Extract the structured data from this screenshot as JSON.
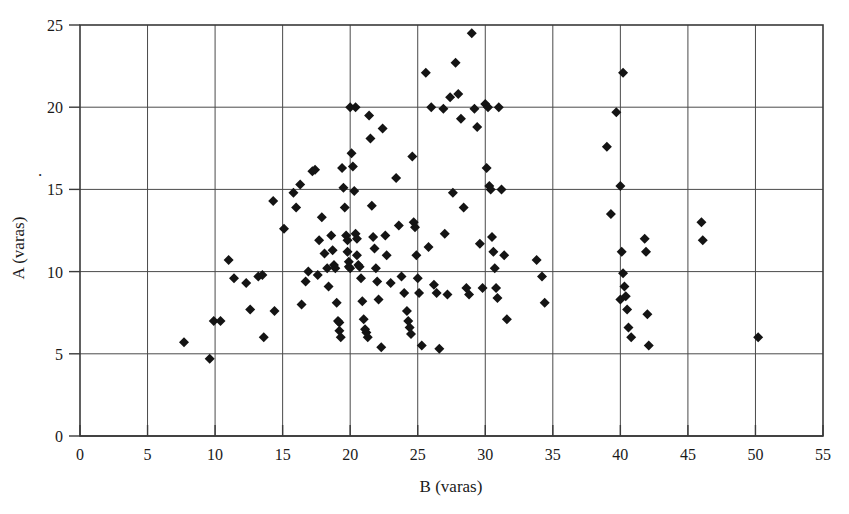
{
  "chart_data": {
    "type": "scatter",
    "title": "",
    "xlabel": "B (varas)",
    "ylabel": "A (varas)",
    "xlim": [
      0,
      55
    ],
    "ylim": [
      0,
      25
    ],
    "xticks": [
      0,
      5,
      10,
      15,
      20,
      25,
      30,
      35,
      40,
      45,
      50,
      55
    ],
    "yticks": [
      0,
      5,
      10,
      15,
      20,
      25
    ],
    "xtick_labels": [
      "0",
      "5",
      "10",
      "15",
      "20",
      "25",
      "30",
      "35",
      "40",
      "45",
      "50",
      "55"
    ],
    "ytick_labels": [
      "0",
      "5",
      "10",
      "15",
      "20",
      "25"
    ],
    "grid": true,
    "grid_x": true,
    "grid_y": true,
    "legend": false,
    "legend_position": "none",
    "marker": "diamond",
    "marker_color": "#141414",
    "marker_size": 9,
    "n_points": 146,
    "points": [
      [
        7.7,
        5.7
      ],
      [
        9.6,
        4.7
      ],
      [
        9.9,
        7.0
      ],
      [
        10.4,
        7.0
      ],
      [
        11.0,
        10.7
      ],
      [
        11.4,
        9.6
      ],
      [
        12.3,
        9.3
      ],
      [
        12.6,
        7.7
      ],
      [
        13.2,
        9.7
      ],
      [
        13.5,
        9.8
      ],
      [
        13.6,
        6.0
      ],
      [
        14.3,
        14.3
      ],
      [
        14.4,
        7.6
      ],
      [
        15.1,
        12.6
      ],
      [
        15.8,
        14.8
      ],
      [
        16.0,
        13.9
      ],
      [
        16.3,
        15.3
      ],
      [
        16.4,
        8.0
      ],
      [
        16.7,
        9.4
      ],
      [
        16.9,
        10.0
      ],
      [
        17.2,
        16.1
      ],
      [
        17.4,
        16.2
      ],
      [
        17.6,
        9.8
      ],
      [
        17.7,
        11.9
      ],
      [
        17.9,
        13.3
      ],
      [
        18.1,
        11.1
      ],
      [
        18.3,
        10.2
      ],
      [
        18.4,
        9.1
      ],
      [
        18.6,
        12.2
      ],
      [
        18.7,
        11.3
      ],
      [
        18.8,
        10.4
      ],
      [
        18.9,
        10.2
      ],
      [
        19.0,
        8.1
      ],
      [
        19.1,
        7.0
      ],
      [
        19.2,
        6.9
      ],
      [
        19.2,
        6.4
      ],
      [
        19.3,
        6.0
      ],
      [
        19.4,
        16.3
      ],
      [
        19.5,
        15.1
      ],
      [
        19.6,
        13.9
      ],
      [
        19.7,
        12.2
      ],
      [
        19.8,
        11.9
      ],
      [
        19.8,
        11.2
      ],
      [
        19.9,
        10.6
      ],
      [
        19.9,
        10.3
      ],
      [
        20.0,
        10.2
      ],
      [
        20.0,
        20.0
      ],
      [
        20.4,
        20.0
      ],
      [
        20.1,
        17.2
      ],
      [
        20.2,
        16.4
      ],
      [
        20.3,
        14.9
      ],
      [
        20.4,
        12.3
      ],
      [
        20.5,
        12.0
      ],
      [
        20.5,
        11.0
      ],
      [
        20.6,
        10.4
      ],
      [
        20.7,
        10.3
      ],
      [
        20.8,
        9.6
      ],
      [
        20.9,
        8.2
      ],
      [
        21.0,
        7.1
      ],
      [
        21.1,
        6.5
      ],
      [
        21.2,
        6.3
      ],
      [
        21.3,
        6.0
      ],
      [
        21.4,
        19.5
      ],
      [
        21.5,
        18.1
      ],
      [
        21.6,
        14.0
      ],
      [
        21.7,
        12.1
      ],
      [
        21.8,
        11.4
      ],
      [
        21.9,
        10.2
      ],
      [
        22.0,
        9.4
      ],
      [
        22.1,
        8.3
      ],
      [
        22.3,
        5.4
      ],
      [
        22.4,
        18.7
      ],
      [
        22.6,
        12.2
      ],
      [
        22.7,
        11.0
      ],
      [
        23.0,
        9.3
      ],
      [
        23.4,
        15.7
      ],
      [
        23.6,
        12.8
      ],
      [
        23.8,
        9.7
      ],
      [
        24.0,
        8.7
      ],
      [
        24.2,
        7.6
      ],
      [
        24.3,
        7.0
      ],
      [
        24.4,
        6.6
      ],
      [
        24.5,
        6.2
      ],
      [
        24.6,
        17.0
      ],
      [
        24.7,
        13.0
      ],
      [
        24.8,
        12.7
      ],
      [
        24.9,
        11.0
      ],
      [
        25.0,
        9.6
      ],
      [
        25.1,
        8.7
      ],
      [
        25.3,
        5.5
      ],
      [
        25.6,
        22.1
      ],
      [
        25.8,
        11.5
      ],
      [
        26.0,
        20.0
      ],
      [
        26.2,
        9.2
      ],
      [
        26.4,
        8.7
      ],
      [
        26.6,
        5.3
      ],
      [
        26.9,
        19.9
      ],
      [
        27.0,
        12.3
      ],
      [
        27.2,
        8.6
      ],
      [
        27.4,
        20.6
      ],
      [
        27.6,
        14.8
      ],
      [
        27.8,
        22.7
      ],
      [
        28.0,
        20.8
      ],
      [
        28.2,
        19.3
      ],
      [
        28.4,
        13.9
      ],
      [
        28.6,
        9.0
      ],
      [
        28.8,
        8.6
      ],
      [
        29.0,
        24.5
      ],
      [
        29.2,
        19.9
      ],
      [
        29.4,
        18.8
      ],
      [
        29.6,
        11.7
      ],
      [
        29.8,
        9.0
      ],
      [
        30.0,
        20.2
      ],
      [
        30.2,
        20.0
      ],
      [
        30.1,
        16.3
      ],
      [
        30.3,
        15.2
      ],
      [
        30.4,
        15.0
      ],
      [
        30.5,
        12.1
      ],
      [
        30.6,
        11.2
      ],
      [
        30.7,
        10.2
      ],
      [
        30.8,
        9.0
      ],
      [
        30.9,
        8.4
      ],
      [
        31.0,
        20.0
      ],
      [
        31.2,
        15.0
      ],
      [
        31.4,
        11.0
      ],
      [
        31.6,
        7.1
      ],
      [
        33.8,
        10.7
      ],
      [
        34.2,
        9.7
      ],
      [
        34.4,
        8.1
      ],
      [
        39.0,
        17.6
      ],
      [
        39.3,
        13.5
      ],
      [
        39.7,
        19.7
      ],
      [
        40.0,
        15.2
      ],
      [
        40.1,
        11.2
      ],
      [
        40.2,
        9.9
      ],
      [
        40.3,
        9.1
      ],
      [
        40.4,
        8.5
      ],
      [
        40.0,
        8.3
      ],
      [
        40.5,
        7.7
      ],
      [
        40.6,
        6.6
      ],
      [
        40.8,
        6.0
      ],
      [
        40.2,
        22.1
      ],
      [
        41.8,
        12.0
      ],
      [
        41.9,
        11.2
      ],
      [
        42.0,
        7.4
      ],
      [
        42.1,
        5.5
      ],
      [
        46.0,
        13.0
      ],
      [
        46.1,
        11.9
      ],
      [
        50.2,
        6.0
      ]
    ]
  },
  "axes": {
    "x_axis_name": "B (varas)",
    "y_axis_name": "A (varas)",
    "stray_mark": "."
  }
}
